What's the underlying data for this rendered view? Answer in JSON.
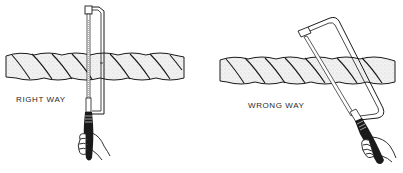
{
  "figure": {
    "panels": [
      {
        "id": "right",
        "label": "RIGHT WAY",
        "description": "Hacksaw held vertically, perpendicular to the rope"
      },
      {
        "id": "wrong",
        "label": "WRONG WAY",
        "description": "Hacksaw held at an angle to the rope"
      }
    ],
    "colors": {
      "ink": "#1a1a1a",
      "rope_fill": "#e9e9e9",
      "background": "#ffffff"
    }
  }
}
